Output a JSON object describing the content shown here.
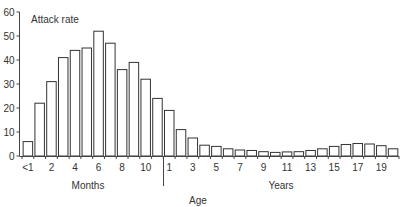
{
  "chart_data": {
    "type": "bar",
    "title": "",
    "ylabel": "Attack rate",
    "xlabel": "Age",
    "x_groups": [
      {
        "name": "Months",
        "range": [
          "<1",
          "11"
        ]
      },
      {
        "name": "Years",
        "range": [
          "1",
          "20"
        ]
      }
    ],
    "categories": [
      "<1",
      "1",
      "2",
      "3",
      "4",
      "5",
      "6",
      "7",
      "8",
      "9",
      "10",
      "11",
      "1",
      "2",
      "3",
      "4",
      "5",
      "6",
      "7",
      "8",
      "9",
      "10",
      "11",
      "12",
      "13",
      "14",
      "15",
      "16",
      "17",
      "18",
      "19",
      "20"
    ],
    "category_units": [
      "months",
      "months",
      "months",
      "months",
      "months",
      "months",
      "months",
      "months",
      "months",
      "months",
      "months",
      "months",
      "years",
      "years",
      "years",
      "years",
      "years",
      "years",
      "years",
      "years",
      "years",
      "years",
      "years",
      "years",
      "years",
      "years",
      "years",
      "years",
      "years",
      "years",
      "years",
      "years"
    ],
    "values": [
      6,
      22,
      31,
      41,
      44,
      45,
      52,
      47,
      36,
      39,
      32,
      24,
      19,
      11,
      7.5,
      4.5,
      4,
      3,
      2.5,
      2.3,
      1.8,
      1.5,
      1.7,
      1.8,
      2.3,
      3,
      4,
      4.8,
      5.2,
      5,
      4.3,
      3
    ],
    "ylim": [
      0,
      60
    ],
    "yticks": [
      0,
      10,
      20,
      30,
      40,
      50,
      60
    ],
    "xtick_labels": [
      {
        "index": 0,
        "label": "<1"
      },
      {
        "index": 2,
        "label": "2"
      },
      {
        "index": 4,
        "label": "4"
      },
      {
        "index": 6,
        "label": "6"
      },
      {
        "index": 8,
        "label": "8"
      },
      {
        "index": 10,
        "label": "10"
      },
      {
        "index": 12,
        "label": "1"
      },
      {
        "index": 14,
        "label": "3"
      },
      {
        "index": 16,
        "label": "5"
      },
      {
        "index": 18,
        "label": "7"
      },
      {
        "index": 20,
        "label": "9"
      },
      {
        "index": 22,
        "label": "11"
      },
      {
        "index": 24,
        "label": "13"
      },
      {
        "index": 26,
        "label": "15"
      },
      {
        "index": 28,
        "label": "17"
      },
      {
        "index": 30,
        "label": "19"
      }
    ],
    "grid": false,
    "legend": null,
    "bar_style": {
      "fill": "#ffffff",
      "stroke": "#333333"
    }
  },
  "labels": {
    "y_axis_title": "Attack rate",
    "group_months": "Months",
    "group_years": "Years",
    "x_axis_title": "Age"
  }
}
